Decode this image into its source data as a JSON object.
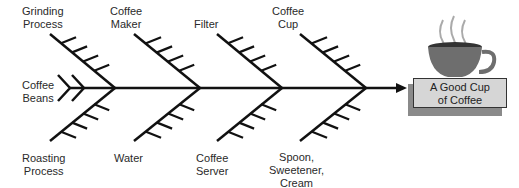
{
  "diagram": {
    "type": "fishbone",
    "effect": {
      "line1": "A Good Cup",
      "line2": "of Coffee"
    },
    "causes_top": [
      {
        "line1": "Grinding",
        "line2": "Process"
      },
      {
        "line1": "Coffee",
        "line2": "Maker"
      },
      {
        "line1": "",
        "line2": "Filter"
      },
      {
        "line1": "Coffee",
        "line2": "Cup"
      }
    ],
    "causes_bottom": [
      {
        "line1": "Roasting",
        "line2": "Process"
      },
      {
        "line1": "Water",
        "line2": ""
      },
      {
        "line1": "Coffee",
        "line2": "Server"
      },
      {
        "line1": "Spoon,",
        "line2": "Sweetener,",
        "line3": "Cream"
      }
    ],
    "tail_cause": {
      "line1": "Coffee",
      "line2": "Beans"
    },
    "icons": {
      "effect_image": "coffee-cup-icon"
    },
    "colors": {
      "lines": "#111111",
      "box": "#d6d6d6",
      "shadow": "#8a8a8a",
      "cup": "#6e6e6e"
    }
  }
}
